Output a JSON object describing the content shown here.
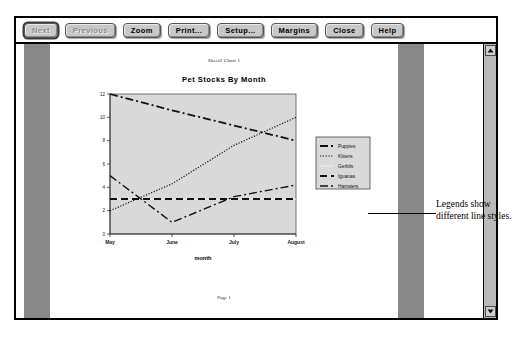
{
  "window": {
    "toolbar": {
      "buttons": [
        {
          "label": "Next",
          "state": "focused-disabled",
          "name": "next-button"
        },
        {
          "label": "Previous",
          "state": "disabled",
          "name": "previous-button"
        },
        {
          "label": "Zoom",
          "state": "enabled",
          "name": "zoom-button"
        },
        {
          "label": "Print...",
          "state": "enabled",
          "name": "print-button"
        },
        {
          "label": "Setup...",
          "state": "enabled",
          "name": "setup-button"
        },
        {
          "label": "Margins",
          "state": "enabled",
          "name": "margins-button"
        },
        {
          "label": "Close",
          "state": "enabled",
          "name": "close-button"
        },
        {
          "label": "Help",
          "state": "enabled",
          "name": "help-button"
        }
      ]
    },
    "scrollbar": {
      "up_arrow": "scroll-up-arrow-icon",
      "down_arrow": "scroll-down-arrow-icon"
    }
  },
  "page": {
    "sheet_caption": "Sheet2 Chart 1",
    "footer": "Page 1"
  },
  "annotation": {
    "text": "Legends show different line styles."
  },
  "colors": {
    "page_surround": "#888888",
    "plot_background": "#d9d9d9",
    "button_face": "#c8c8c8",
    "ink": "#000000"
  },
  "chart_data": {
    "type": "line",
    "title": "Pet Stocks By Month",
    "xlabel": "month",
    "ylabel": "",
    "categories": [
      "May",
      "June",
      "July",
      "August"
    ],
    "x": [
      0,
      1,
      2,
      3
    ],
    "ylim": [
      0,
      12
    ],
    "yticks": [
      0,
      2,
      4,
      6,
      8,
      10,
      12
    ],
    "grid": false,
    "legend_position": "right-outside",
    "series": [
      {
        "name": "Puppies",
        "values": [
          12,
          10.6,
          9.3,
          8
        ],
        "style": "dash-dot",
        "width": 1.8
      },
      {
        "name": "Kittens",
        "values": [
          2,
          4.3,
          7.6,
          10
        ],
        "style": "dotted",
        "width": 1.2
      },
      {
        "name": "Gerbils",
        "values": [
          3,
          3,
          3,
          3
        ],
        "style": "solid-faint",
        "width": 1.0
      },
      {
        "name": "Iguanas",
        "values": [
          3,
          3,
          3,
          3
        ],
        "style": "long-dash",
        "width": 1.8
      },
      {
        "name": "Hamsters",
        "values": [
          5,
          1,
          3.2,
          4.2
        ],
        "style": "dash-dot",
        "width": 1.4
      }
    ]
  }
}
